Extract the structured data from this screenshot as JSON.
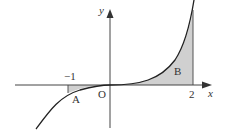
{
  "diagram": {
    "curve": "y = x^3",
    "axis_labels": {
      "x": "x",
      "y": "y"
    },
    "origin_label": "O",
    "tick_labels": {
      "neg_one": "−1",
      "two": "2"
    },
    "regions": [
      {
        "label": "A",
        "from": -1,
        "to": 0
      },
      {
        "label": "B",
        "from": 0,
        "to": 2
      }
    ],
    "colors": {
      "shade": "#d0d0d0",
      "line": "#222222"
    }
  }
}
